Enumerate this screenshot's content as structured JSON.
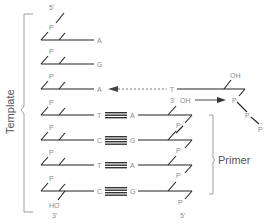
{
  "diagram": {
    "template_label": "Template",
    "primer_label": "Primer",
    "template_5prime": "5'",
    "template_3prime": "3'",
    "template_3prime_group": "HO",
    "primer_5prime": "5'",
    "primer_3prime": "3'",
    "primer_3prime_group": "OH",
    "phosphate": "P",
    "incoming_nucleotide": {
      "base": "T",
      "sugar_group": "OH",
      "triphosphate": [
        "P",
        "P",
        "P"
      ]
    },
    "template_bases": [
      "A",
      "G",
      "A",
      "T",
      "C",
      "T",
      "C"
    ],
    "primer_bases": [
      "A",
      "G",
      "A",
      "G"
    ],
    "colors": {
      "line": "#222222",
      "label": "#8a8a8a",
      "bracket": "#888888",
      "hbond": "#333333"
    }
  }
}
